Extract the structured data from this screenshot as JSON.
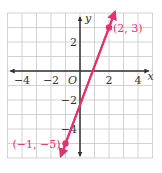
{
  "chart_data": {
    "type": "line",
    "title": "",
    "xlabel": "x",
    "ylabel": "y",
    "origin_label": "O",
    "xlim": [
      -5,
      5
    ],
    "ylim": [
      -6,
      4
    ],
    "grid": true,
    "x_ticks": [
      {
        "value": -4,
        "label": "−4"
      },
      {
        "value": -2,
        "label": "−2"
      },
      {
        "value": 2,
        "label": "2"
      },
      {
        "value": 4,
        "label": "4"
      }
    ],
    "y_ticks": [
      {
        "value": 2,
        "label": "2"
      },
      {
        "value": -2,
        "label": "−2"
      },
      {
        "value": -4,
        "label": "−4"
      }
    ],
    "series": [
      {
        "name": "line through (−1, −5) and (2, 3)",
        "equation": "y = (8/3)x − 7/3",
        "x": [
          -1,
          2
        ],
        "y": [
          -5,
          3
        ]
      }
    ],
    "points": [
      {
        "x": 2,
        "y": 3,
        "label": "(2, 3)"
      },
      {
        "x": -1,
        "y": -5,
        "label": "(−1, −5)"
      }
    ],
    "legend": null
  },
  "colors": {
    "line": "#e0336f",
    "grid": "#c8c8c8",
    "axis": "#333333"
  }
}
